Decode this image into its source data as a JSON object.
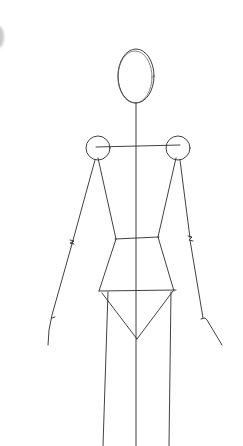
{
  "sketch": {
    "subject": "fashion croquis stick figure",
    "medium": "pencil on white paper",
    "colors": {
      "paper": "#ffffff",
      "line": "#2b2b2b"
    },
    "parts": [
      "head-oval",
      "center-balance-line",
      "shoulder-line",
      "left-shoulder-joint",
      "right-shoulder-joint",
      "torso-sides",
      "waist-line",
      "hip-line",
      "crotch-triangle",
      "left-arm",
      "right-arm",
      "legs"
    ]
  }
}
